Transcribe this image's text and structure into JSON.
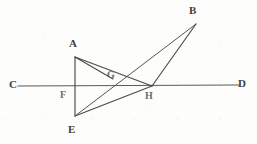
{
  "figure": {
    "kind": "geometry-diagram",
    "caption": "",
    "background_color": "#fdfdfc",
    "ink_color": "#4a4a48",
    "canvas": {
      "width": 257,
      "height": 144
    },
    "points": {
      "A": {
        "x": 75,
        "y": 57,
        "label": "A",
        "label_x": 69,
        "label_y": 38
      },
      "B": {
        "x": 196,
        "y": 24,
        "label": "B",
        "label_x": 189,
        "label_y": 5
      },
      "C": {
        "x": 18,
        "y": 86,
        "label": "C",
        "label_x": 9,
        "label_y": 79
      },
      "D": {
        "x": 239,
        "y": 85,
        "label": "D",
        "label_x": 238,
        "label_y": 78
      },
      "E": {
        "x": 75,
        "y": 116,
        "label": "E",
        "label_x": 68,
        "label_y": 124
      },
      "F": {
        "x": 75,
        "y": 86,
        "label": "F",
        "label_x": 61,
        "label_y": 90
      },
      "G": {
        "x": 113,
        "y": 79,
        "label": "G",
        "label_x": 107,
        "label_y": 70
      },
      "H": {
        "x": 152,
        "y": 86,
        "label": "H",
        "label_x": 146,
        "label_y": 91
      }
    },
    "segments": [
      {
        "name": "line-C-D",
        "from": "C",
        "to": "D",
        "style": "axis",
        "description": "horizontal straight line C D through F, G and H"
      },
      {
        "name": "line-A-E",
        "from": "A",
        "to": "E",
        "style": "plain",
        "description": "vertical segment A E crossing C D at F"
      },
      {
        "name": "line-A-G",
        "from": "A",
        "to": "G",
        "style": "plain",
        "description": "segment from A to G"
      },
      {
        "name": "line-A-H",
        "from": "A",
        "to": "H",
        "style": "plain",
        "description": "segment from A to H"
      },
      {
        "name": "line-E-H",
        "from": "E",
        "to": "H",
        "style": "plain",
        "description": "segment from E to H"
      },
      {
        "name": "line-E-B",
        "from": "E",
        "to": "B",
        "style": "thin",
        "description": "segment from E through G up to B"
      },
      {
        "name": "line-H-B",
        "from": "H",
        "to": "B",
        "style": "plain",
        "description": "segment from H up to B"
      }
    ],
    "labels": [
      {
        "name": "vertex-label-A",
        "text": "A",
        "x": 69,
        "y": 38,
        "faded": false,
        "small": false
      },
      {
        "name": "vertex-label-B",
        "text": "B",
        "x": 189,
        "y": 5,
        "faded": false,
        "small": false
      },
      {
        "name": "vertex-label-C",
        "text": "C",
        "x": 9,
        "y": 79,
        "faded": false,
        "small": false
      },
      {
        "name": "vertex-label-D",
        "text": "D",
        "x": 238,
        "y": 78,
        "faded": false,
        "small": false
      },
      {
        "name": "vertex-label-E",
        "text": "E",
        "x": 68,
        "y": 124,
        "faded": false,
        "small": false
      },
      {
        "name": "vertex-label-F",
        "text": "F",
        "x": 60,
        "y": 90,
        "faded": true,
        "small": true
      },
      {
        "name": "vertex-label-G",
        "text": "G",
        "x": 107,
        "y": 70,
        "faded": true,
        "small": true
      },
      {
        "name": "vertex-label-H",
        "text": "H",
        "x": 145,
        "y": 91,
        "faded": true,
        "small": true
      }
    ]
  }
}
